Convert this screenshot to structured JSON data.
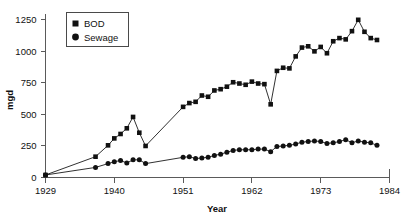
{
  "chart_data": {
    "type": "line",
    "title": "",
    "xlabel": "Year",
    "ylabel": "mgd",
    "xlim": [
      1929,
      1984
    ],
    "ylim": [
      0,
      1300
    ],
    "xticks": [
      1929,
      1940,
      1951,
      1962,
      1973,
      1984
    ],
    "yticks": [
      0,
      250,
      500,
      750,
      1000,
      1250
    ],
    "grid": false,
    "legend_position": "top-left",
    "series": [
      {
        "name": "BOD",
        "marker": "square",
        "color": "#111111",
        "x": [
          1929,
          1937,
          1939,
          1940,
          1941,
          1942,
          1943,
          1944,
          1945,
          1951,
          1952,
          1953,
          1954,
          1955,
          1956,
          1957,
          1958,
          1959,
          1960,
          1961,
          1962,
          1963,
          1964,
          1965,
          1966,
          1967,
          1968,
          1969,
          1970,
          1971,
          1972,
          1973,
          1974,
          1975,
          1976,
          1977,
          1978,
          1979,
          1980,
          1981,
          1982
        ],
        "y": [
          20,
          165,
          255,
          310,
          345,
          390,
          480,
          355,
          250,
          560,
          590,
          600,
          650,
          640,
          690,
          700,
          720,
          755,
          745,
          735,
          760,
          745,
          740,
          580,
          845,
          870,
          865,
          960,
          1030,
          1040,
          1000,
          1035,
          985,
          1080,
          1105,
          1095,
          1160,
          1250,
          1155,
          1105,
          1090
        ]
      },
      {
        "name": "Sewage",
        "marker": "circle",
        "color": "#111111",
        "x": [
          1929,
          1937,
          1939,
          1940,
          1941,
          1942,
          1943,
          1944,
          1945,
          1951,
          1952,
          1953,
          1954,
          1955,
          1956,
          1957,
          1958,
          1959,
          1960,
          1961,
          1962,
          1963,
          1964,
          1965,
          1966,
          1967,
          1968,
          1969,
          1970,
          1971,
          1972,
          1973,
          1974,
          1975,
          1976,
          1977,
          1978,
          1979,
          1980,
          1981,
          1982
        ],
        "y": [
          20,
          80,
          110,
          125,
          135,
          115,
          140,
          140,
          110,
          160,
          165,
          150,
          155,
          160,
          175,
          185,
          200,
          215,
          220,
          220,
          220,
          225,
          225,
          205,
          245,
          250,
          255,
          265,
          280,
          285,
          290,
          285,
          270,
          275,
          285,
          300,
          275,
          290,
          280,
          275,
          255
        ]
      }
    ],
    "legend": [
      "BOD",
      "Sewage"
    ]
  }
}
